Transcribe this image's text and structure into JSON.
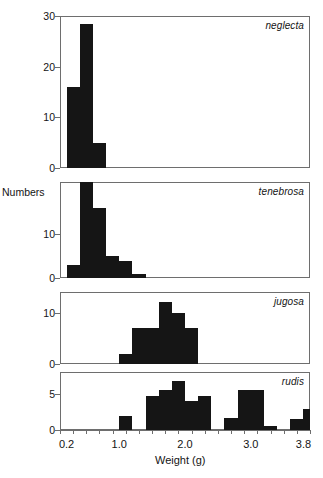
{
  "figure": {
    "axis_title_x": "Weight (g)",
    "axis_title_y": "Numbers",
    "panel_labels": [
      "neglecta",
      "tenebrosa",
      "jugosa",
      "rudis"
    ]
  },
  "chart_data": {
    "type": "bar",
    "title": "",
    "xlabel": "Weight (g)",
    "ylabel": "Numbers",
    "xlim": [
      0.1,
      3.9
    ],
    "xticks_major": [
      0.2,
      1.0,
      2.0,
      3.0,
      3.8
    ],
    "xtick_major_labels": [
      "0.2",
      "1.0",
      "2.0",
      "3.0",
      "3.8"
    ],
    "xtick_step_minor": 0.2,
    "grid": false,
    "legend": "panel-label-top-right",
    "bin_width": 0.2,
    "panels": [
      {
        "label": "neglecta",
        "ylim": [
          0,
          30
        ],
        "yticks": [
          0,
          10,
          20,
          30
        ],
        "ytick_labels": [
          "0",
          "10",
          "20",
          "30"
        ],
        "bin_starts": [
          0.2,
          0.4,
          0.6
        ],
        "values": [
          16,
          28.5,
          5
        ]
      },
      {
        "label": "tenebrosa",
        "ylim": [
          0,
          22
        ],
        "yticks": [
          0,
          10
        ],
        "ytick_labels": [
          "0",
          "10"
        ],
        "bin_starts": [
          0.2,
          0.4,
          0.6,
          0.8,
          1.0,
          1.2
        ],
        "values": [
          3,
          22,
          16,
          5,
          4,
          1
        ]
      },
      {
        "label": "jugosa",
        "ylim": [
          0,
          14
        ],
        "yticks": [
          0,
          10
        ],
        "ytick_labels": [
          "0",
          "10"
        ],
        "bin_starts": [
          1.0,
          1.2,
          1.4,
          1.6,
          1.8,
          2.0
        ],
        "values": [
          2,
          7,
          7,
          12,
          10,
          7
        ]
      },
      {
        "label": "rudis",
        "ylim": [
          0,
          8
        ],
        "yticks": [
          0,
          5
        ],
        "ytick_labels": [
          "0",
          "5"
        ],
        "bin_starts": [
          1.0,
          1.4,
          1.6,
          1.8,
          2.0,
          2.2,
          2.6,
          2.8,
          3.0,
          3.2,
          3.6,
          3.8
        ],
        "values": [
          2,
          4.7,
          5.5,
          6.7,
          4,
          4.7,
          1.7,
          5.5,
          5.5,
          0.6,
          1.5,
          2.9
        ]
      }
    ],
    "panel_geometry": [
      {
        "left": 60,
        "top": 16,
        "width": 250,
        "height": 152
      },
      {
        "left": 60,
        "top": 182,
        "width": 250,
        "height": 96
      },
      {
        "left": 60,
        "top": 292,
        "width": 250,
        "height": 72
      },
      {
        "left": 60,
        "top": 372,
        "width": 250,
        "height": 58
      }
    ]
  }
}
